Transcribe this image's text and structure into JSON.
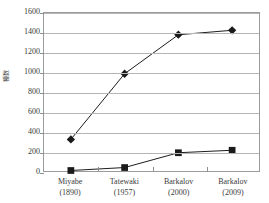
{
  "chart_data": {
    "type": "line",
    "title": "",
    "xlabel": "",
    "ylabel": "種数",
    "categories": [
      "Miyabe",
      "Tatewaki",
      "Barkalov",
      "Barkalov"
    ],
    "category_years": [
      "(1890)",
      "(1957)",
      "(2000)",
      "(2009)"
    ],
    "x_tick_labels": [
      {
        "name": "Miyabe",
        "year": "(1890)"
      },
      {
        "name": "Tatewaki",
        "year": "(1957)"
      },
      {
        "name": "Barkalov",
        "year": "(2000)"
      },
      {
        "name": "Barkalov",
        "year": "(2009)"
      }
    ],
    "ylim": [
      0,
      1600
    ],
    "y_ticks": [
      0,
      200,
      400,
      600,
      800,
      1000,
      1200,
      1400,
      1600
    ],
    "y_tick_labels": [
      "0",
      "200",
      "400",
      "600",
      "800",
      "1000",
      "1200",
      "1400",
      "1600"
    ],
    "grid": true,
    "legend": "none",
    "series": [
      {
        "name": "total",
        "marker": "diamond",
        "color": "#1a1a1a",
        "values": [
          320,
          985,
          1380,
          1425
        ]
      },
      {
        "name": "subset",
        "marker": "square",
        "color": "#1a1a1a",
        "values": [
          5,
          35,
          185,
          210
        ]
      }
    ]
  }
}
